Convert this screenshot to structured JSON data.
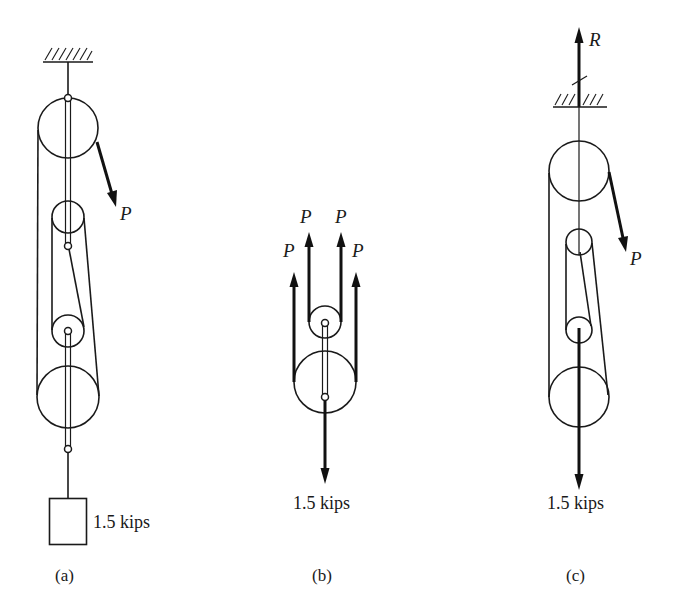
{
  "figure": {
    "panels": [
      {
        "id": "a",
        "caption": "(a)",
        "applied_force_label": "P",
        "load_label": "1.5 kips",
        "support": "fixed ceiling (hatched)",
        "components": [
          "upper large pulley",
          "upper small pulley",
          "lower small pulley",
          "lower large pulley",
          "hanging weight block"
        ]
      },
      {
        "id": "b",
        "caption": "(b)",
        "cable_force_labels": [
          "P",
          "P",
          "P",
          "P"
        ],
        "load_label": "1.5 kips",
        "components": [
          "small pulley",
          "large pulley",
          "connecting link"
        ]
      },
      {
        "id": "c",
        "caption": "(c)",
        "reaction_label": "R",
        "applied_force_label": "P",
        "load_label": "1.5 kips",
        "support": "fixed ceiling (hatched, cut)",
        "components": [
          "upper large pulley",
          "upper small pulley",
          "lower small pulley",
          "lower large pulley"
        ]
      }
    ],
    "colors": {
      "ink": "#1a1a1a",
      "background": "#ffffff"
    }
  }
}
